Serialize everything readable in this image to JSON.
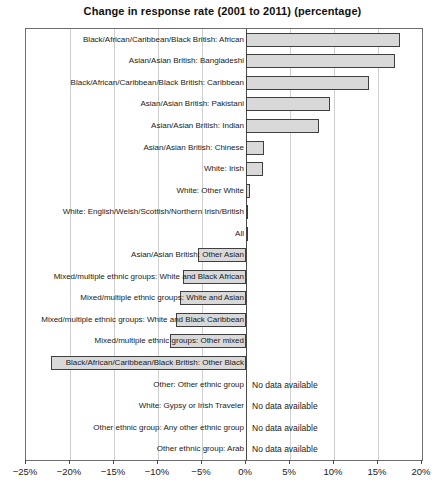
{
  "chart_data": {
    "type": "bar",
    "orientation": "horizontal",
    "title": "Change in response rate (2001 to 2011) (percentage)",
    "categories": [
      "Black/African/Caribbean/Black British: African",
      "Asian/Asian British: Bangladeshi",
      "Black/African/Caribbean/Black British: Caribbean",
      "Asian/Asian British: Pakistani",
      "Asian/Asian British: Indian",
      "Asian/Asian British: Chinese",
      "White: Irish",
      "White: Other White",
      "White: English/Welsh/Scottish/Northern Irish/British",
      "All",
      "Asian/Asian British: Other Asian",
      "Mixed/multiple ethnic groups: White and Black African",
      "Mixed/multiple ethnic groups: White and Asian",
      "Mixed/multiple ethnic groups: White and Black Caribbean",
      "Mixed/multiple ethnic groups: Other mixed",
      "Black/African/Caribbean/Black British: Other Black",
      "Other: Other ethnic group",
      "White: Gypsy or Irish Traveler",
      "Other ethnic group: Any other ethnic group",
      "Other ethnic group: Arab"
    ],
    "values": [
      17.5,
      16.9,
      14,
      9.6,
      8.3,
      2.1,
      1.9,
      0.5,
      0.2,
      0.2,
      -5.5,
      -7.2,
      -7.5,
      -8,
      -8.6,
      -22.2,
      null,
      null,
      null,
      null
    ],
    "no_data_text": "No data available",
    "xlabel": "",
    "ylabel": "",
    "xlim": [
      -25,
      20
    ],
    "x_tick_values": [
      -25,
      -20,
      -15,
      -10,
      -5,
      0,
      5,
      10,
      15,
      20
    ],
    "x_tick_labels": [
      "−25%",
      "−20%",
      "−15%",
      "−10%",
      "−5%",
      "0%",
      "5%",
      "10%",
      "15%",
      "20%"
    ],
    "grid": true,
    "legend": false,
    "bar_fill": "#d9d9d9",
    "bar_border": "#3f3f3f",
    "frame_color": "#6e6e6e"
  }
}
